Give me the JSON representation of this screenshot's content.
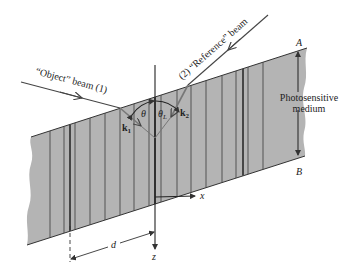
{
  "diagram": {
    "title": "",
    "colors": {
      "medium_fill": "#b4b4b4",
      "line": "#333333",
      "fringe": "#3a3a3a",
      "background": "#ffffff"
    },
    "labels": {
      "object_beam": "“Object” beam (1)",
      "reference_beam": "(2) “Reference” beam",
      "medium_line1": "Photosensitive",
      "medium_line2": "medium",
      "point_a": "A",
      "point_b": "B",
      "theta": "θ",
      "theta_l": "θ",
      "theta_l_sub": "L",
      "k1": "k",
      "k1_sub": "1",
      "k2": "k",
      "k2_sub": "2",
      "axis_x": "x",
      "axis_z": "z",
      "spacing_d": "d"
    },
    "fringes": [
      {
        "x": 50,
        "w": 0.8
      },
      {
        "x": 64,
        "w": 0.8
      },
      {
        "x": 70,
        "w": 1.8
      },
      {
        "x": 75,
        "w": 0.8
      },
      {
        "x": 90,
        "w": 0.8
      },
      {
        "x": 105,
        "w": 0.8
      },
      {
        "x": 120,
        "w": 0.8
      },
      {
        "x": 134,
        "w": 0.8
      },
      {
        "x": 149,
        "w": 0.8
      },
      {
        "x": 155,
        "w": 1.8
      },
      {
        "x": 161,
        "w": 0.8
      },
      {
        "x": 177,
        "w": 0.8
      },
      {
        "x": 191,
        "w": 0.8
      },
      {
        "x": 206,
        "w": 0.8
      },
      {
        "x": 222,
        "w": 0.8
      },
      {
        "x": 236,
        "w": 0.8
      },
      {
        "x": 243,
        "w": 1.8
      },
      {
        "x": 248,
        "w": 0.8
      },
      {
        "x": 263,
        "w": 0.8
      }
    ]
  }
}
